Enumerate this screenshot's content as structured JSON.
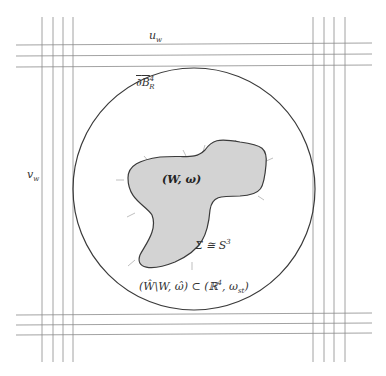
{
  "diagram": {
    "colors": {
      "background": "#ffffff",
      "grid_line": "#8a8a8a",
      "circle_stroke": "#3a3a3a",
      "blob_fill": "#d3d3d3",
      "blob_stroke": "#3a3a3a",
      "arrow": "#b0b0b0",
      "text": "#333333"
    },
    "labels": {
      "u_w": "u",
      "u_w_sub": "w",
      "v_w": "v",
      "v_w_sub": "w",
      "boundary_prefix": "∂",
      "boundary_B": "B",
      "boundary_sup": "4",
      "boundary_sub": "R",
      "filling": "(W, ω)",
      "sigma": "Σ ≅ S",
      "sigma_sup": "3",
      "complement_left": "(Ŵ\\W, ω̂) ⊂ (ℝ",
      "complement_sup": "4",
      "complement_mid": ", ω",
      "complement_sub": "st",
      "complement_right": ")"
    },
    "grid": {
      "left_verticals_x": [
        42,
        53,
        63,
        73
      ],
      "right_verticals_x": [
        313,
        324,
        334,
        345
      ],
      "top_horizontals_y": [
        45,
        56,
        67
      ],
      "bottom_horizontals_y": [
        313,
        323,
        333
      ],
      "vertical_span_y": [
        17,
        362
      ],
      "horizontal_span_x": [
        16,
        372
      ]
    },
    "ball": {
      "center_x": 194,
      "center_y": 189,
      "radius": 121
    }
  }
}
